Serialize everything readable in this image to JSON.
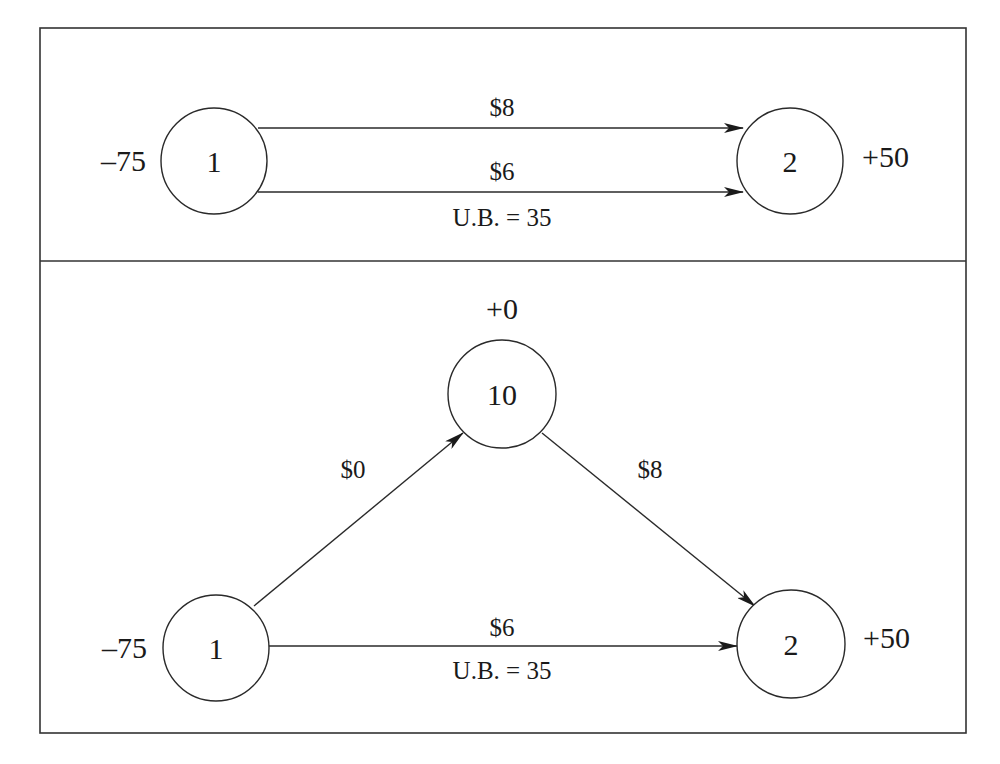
{
  "diagram": {
    "type": "network-flow",
    "colors": {
      "line": "#2a2a2a",
      "text": "#1a1a1a",
      "background": "#ffffff",
      "frame": "#333333"
    },
    "top_panel": {
      "nodes": [
        {
          "id": "1",
          "label": "1",
          "supply": "–75"
        },
        {
          "id": "2",
          "label": "2",
          "supply": "+50"
        }
      ],
      "edges": [
        {
          "from": "1",
          "to": "2",
          "cost": "$8",
          "bound": ""
        },
        {
          "from": "1",
          "to": "2",
          "cost": "$6",
          "bound": "U.B. = 35"
        }
      ]
    },
    "bottom_panel": {
      "nodes": [
        {
          "id": "1",
          "label": "1",
          "supply": "–75"
        },
        {
          "id": "10",
          "label": "10",
          "supply": "+0"
        },
        {
          "id": "2",
          "label": "2",
          "supply": "+50"
        }
      ],
      "edges": [
        {
          "from": "1",
          "to": "10",
          "cost": "$0",
          "bound": ""
        },
        {
          "from": "10",
          "to": "2",
          "cost": "$8",
          "bound": ""
        },
        {
          "from": "1",
          "to": "2",
          "cost": "$6",
          "bound": "U.B. = 35"
        }
      ]
    }
  }
}
